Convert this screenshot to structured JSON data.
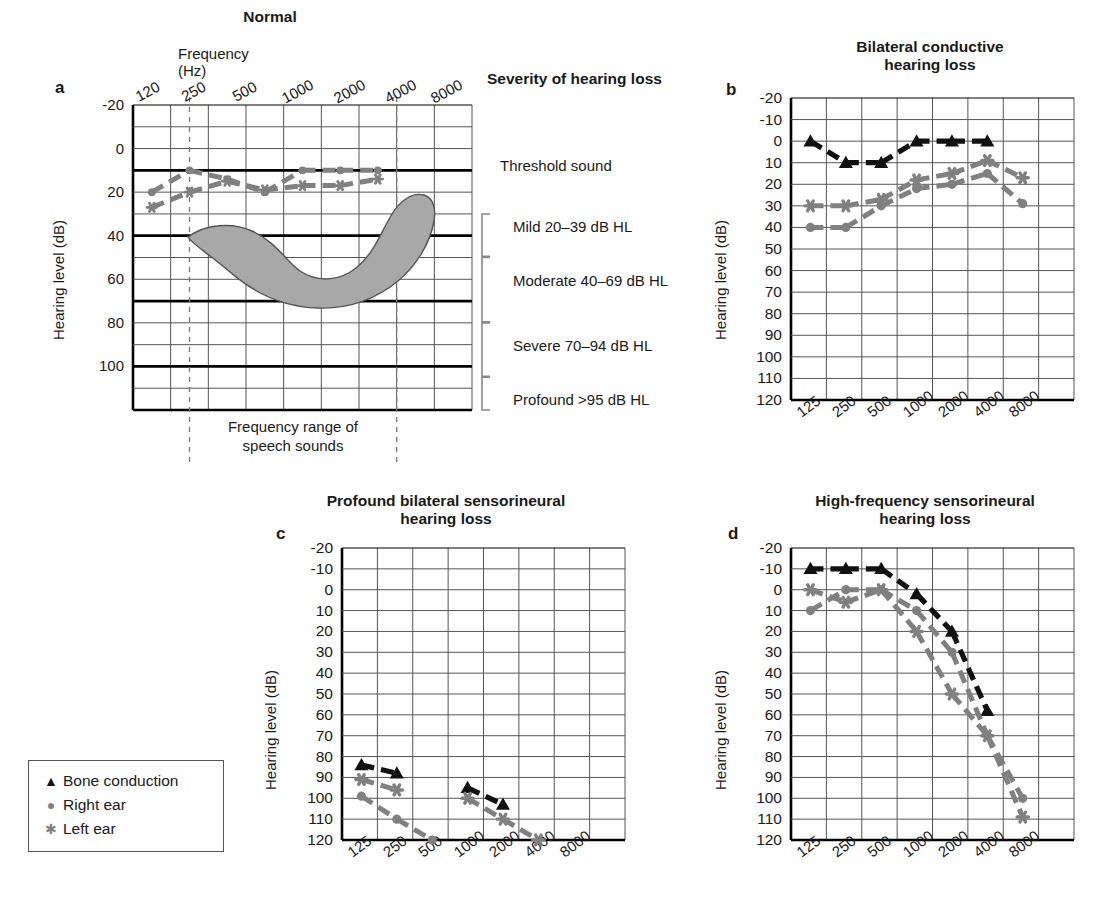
{
  "figure": {
    "legend": {
      "items": [
        {
          "label": "Bone conduction",
          "symbol": "triangle",
          "color": "#111111"
        },
        {
          "label": "Right ear",
          "symbol": "circle",
          "color": "#808080"
        },
        {
          "label": "Left  ear",
          "symbol": "asterisk",
          "color": "#808080"
        }
      ]
    },
    "colors": {
      "bone": "#111111",
      "right_ear": "#808080",
      "left_ear": "#808080",
      "grid": "#555555",
      "bold_line": "#000000",
      "banana_fill": "#a8a8a8",
      "banana_stroke": "#555555"
    }
  },
  "panels": [
    {
      "key": "a",
      "label": "a",
      "title": "Normal",
      "axis_title_top": "Frequency (Hz)",
      "ylabel": "Hearing level  (dB)",
      "xticks": [
        "120",
        "250",
        "500",
        "1000",
        "2000",
        "4000",
        "8000"
      ],
      "yticks": [
        "-20",
        "0",
        "20",
        "40",
        "60",
        "80",
        "100"
      ],
      "speech_caption": "Frequency range of\nspeech sounds",
      "severity_heading": "Severity of hearing loss",
      "severity_items": [
        {
          "label": "Threshold sound",
          "bracket": false
        },
        {
          "label": "Mild 20–39 dB HL",
          "bracket": true
        },
        {
          "label": "Moderate 40–69 dB HL",
          "bracket": true
        },
        {
          "label": "Severe 70–94 dB HL",
          "bracket": true
        },
        {
          "label": "Profound >95 dB HL",
          "bracket": true
        }
      ]
    },
    {
      "key": "b",
      "label": "b",
      "title": "Bilateral conductive\nhearing loss",
      "ylabel": "Hearing level  (dB)",
      "xticks": [
        "125",
        "250",
        "500",
        "1000",
        "2000",
        "4000",
        "8000"
      ],
      "yticks": [
        "-20",
        "-10",
        "0",
        "10",
        "20",
        "30",
        "40",
        "50",
        "60",
        "70",
        "80",
        "90",
        "100",
        "110",
        "120"
      ]
    },
    {
      "key": "c",
      "label": "c",
      "title": "Profound bilateral sensorineural\nhearing loss",
      "ylabel": "Hearing level  (dB)",
      "xticks": [
        "125",
        "250",
        "500",
        "1000",
        "2000",
        "4000",
        "8000"
      ],
      "yticks": [
        "-20",
        "-10",
        "0",
        "10",
        "20",
        "30",
        "40",
        "50",
        "60",
        "70",
        "80",
        "90",
        "100",
        "110",
        "120"
      ]
    },
    {
      "key": "d",
      "label": "d",
      "title": "High-frequency sensorineural\nhearing loss",
      "ylabel": "Hearing level  (dB)",
      "xticks": [
        "125",
        "250",
        "500",
        "1000",
        "2000",
        "4000",
        "8000"
      ],
      "yticks": [
        "-20",
        "-10",
        "0",
        "10",
        "20",
        "30",
        "40",
        "50",
        "60",
        "70",
        "80",
        "90",
        "100",
        "110",
        "120"
      ]
    }
  ],
  "chart_data": [
    {
      "id": "a",
      "type": "line",
      "title": "Normal",
      "xlabel": "Frequency (Hz)",
      "ylabel": "Hearing level  (dB)",
      "x": [
        120,
        250,
        500,
        1000,
        2000,
        4000,
        8000
      ],
      "xlim": [
        120,
        8000
      ],
      "ylim": [
        -30,
        110
      ],
      "y_inverted": true,
      "grid": true,
      "bold_gridlines": [
        0,
        30,
        60,
        90
      ],
      "series": [
        {
          "name": "Right ear",
          "marker": "circle",
          "color": "#808080",
          "values": [
            10,
            0,
            4,
            10,
            0,
            0,
            0
          ]
        },
        {
          "name": "Left  ear",
          "marker": "asterisk",
          "color": "#808080",
          "values": [
            17,
            10,
            5,
            9,
            7,
            7,
            4
          ]
        }
      ],
      "annotations": [
        {
          "name": "speech-banana",
          "text": "Frequency range of speech sounds",
          "x_range": [
            250,
            8000
          ],
          "y_range": [
            18,
            52
          ]
        },
        {
          "name": "speech-range-markers",
          "x_dashed": [
            250,
            8000
          ]
        }
      ],
      "severity_bands": [
        {
          "label": "Threshold sound",
          "level": 0
        },
        {
          "label": "Mild 20–39 dB HL",
          "range": [
            20,
            39
          ]
        },
        {
          "label": "Moderate 40–69 dB HL",
          "range": [
            40,
            69
          ]
        },
        {
          "label": "Severe 70–94 dB HL",
          "range": [
            70,
            94
          ]
        },
        {
          "label": "Profound >95 dB HL",
          "range": [
            95,
            110
          ]
        }
      ]
    },
    {
      "id": "b",
      "type": "line",
      "title": "Bilateral conductive hearing loss",
      "xlabel": "Frequency (Hz)",
      "ylabel": "Hearing level  (dB)",
      "x": [
        125,
        250,
        500,
        1000,
        2000,
        4000,
        8000
      ],
      "xlim": [
        125,
        8000
      ],
      "ylim": [
        -20,
        120
      ],
      "y_inverted": true,
      "grid": true,
      "series": [
        {
          "name": "Bone conduction",
          "marker": "triangle",
          "color": "#111111",
          "values": [
            0,
            10,
            10,
            0,
            0,
            0,
            null
          ]
        },
        {
          "name": "Right ear",
          "marker": "circle",
          "color": "#808080",
          "values": [
            40,
            40,
            30,
            22,
            20,
            15,
            29
          ]
        },
        {
          "name": "Left  ear",
          "marker": "asterisk",
          "color": "#808080",
          "values": [
            30,
            30,
            27,
            18,
            15,
            9,
            17
          ]
        }
      ]
    },
    {
      "id": "c",
      "type": "line",
      "title": "Profound bilateral sensorineural hearing loss",
      "xlabel": "Frequency (Hz)",
      "ylabel": "Hearing level  (dB)",
      "x": [
        125,
        250,
        500,
        1000,
        2000,
        4000,
        8000
      ],
      "xlim": [
        125,
        8000
      ],
      "ylim": [
        -20,
        120
      ],
      "y_inverted": true,
      "grid": true,
      "series": [
        {
          "name": "Bone conduction",
          "marker": "triangle",
          "color": "#111111",
          "values": [
            84,
            88,
            null,
            95,
            103,
            null,
            null
          ]
        },
        {
          "name": "Right ear",
          "marker": "circle",
          "color": "#808080",
          "values": [
            99,
            110,
            120,
            null,
            null,
            null,
            null
          ]
        },
        {
          "name": "Left  ear",
          "marker": "asterisk",
          "color": "#808080",
          "values": [
            91,
            96,
            null,
            100,
            110,
            120,
            null
          ]
        }
      ]
    },
    {
      "id": "d",
      "type": "line",
      "title": "High-frequency sensorineural hearing loss",
      "xlabel": "Frequency (Hz)",
      "ylabel": "Hearing level  (dB)",
      "x": [
        125,
        250,
        500,
        1000,
        2000,
        4000,
        8000
      ],
      "xlim": [
        125,
        8000
      ],
      "ylim": [
        -20,
        120
      ],
      "y_inverted": true,
      "grid": true,
      "series": [
        {
          "name": "Bone conduction",
          "marker": "triangle",
          "color": "#111111",
          "values": [
            -10,
            -10,
            -10,
            2,
            20,
            58,
            null
          ]
        },
        {
          "name": "Right ear",
          "marker": "circle",
          "color": "#808080",
          "values": [
            10,
            0,
            0,
            10,
            30,
            70,
            100
          ]
        },
        {
          "name": "Left  ear",
          "marker": "asterisk",
          "color": "#808080",
          "values": [
            0,
            6,
            0,
            20,
            50,
            70,
            109
          ]
        }
      ]
    }
  ]
}
